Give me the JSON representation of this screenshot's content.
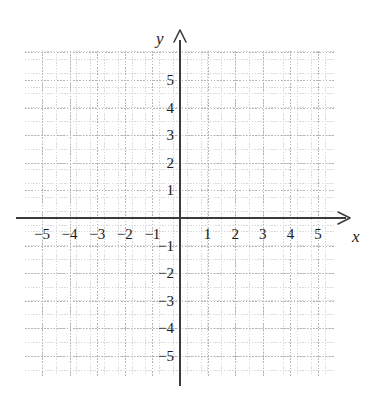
{
  "figure": {
    "kind": "cartesian-coordinate-grid",
    "top_remnant_text": "· · ·",
    "background_color": "#ffffff",
    "axis_color": "#3b3b3b",
    "major_grid_color": "#b5b5b5",
    "minor_grid_color": "#d8d8d8",
    "label_color": "#1a1a1a"
  },
  "axes": {
    "x": {
      "name": "x",
      "arrow": "arrow-right",
      "tick_labels": [
        "−5",
        "−4",
        "−3",
        "−2",
        "−1",
        "1",
        "2",
        "3",
        "4",
        "5"
      ],
      "tick_values": [
        -5,
        -4,
        -3,
        -2,
        -1,
        1,
        2,
        3,
        4,
        5
      ],
      "range": [
        -5.6,
        5.6
      ]
    },
    "y": {
      "name": "y",
      "arrow": "arrow-up",
      "tick_labels": [
        "5",
        "4",
        "3",
        "2",
        "1",
        "−1",
        "−2",
        "−3",
        "−4",
        "−5"
      ],
      "tick_values": [
        5,
        4,
        3,
        2,
        1,
        -1,
        -2,
        -3,
        -4,
        -5
      ],
      "range": [
        -5.8,
        6.0
      ]
    }
  },
  "chart_data": {
    "type": "scatter",
    "title": "",
    "subtitle": "",
    "xlabel": "x",
    "ylabel": "y",
    "xlim": [
      -5.6,
      5.6
    ],
    "ylim": [
      -5.8,
      6.0
    ],
    "xticks": [
      -5,
      -4,
      -3,
      -2,
      -1,
      1,
      2,
      3,
      4,
      5
    ],
    "yticks": [
      5,
      4,
      3,
      2,
      1,
      -1,
      -2,
      -3,
      -4,
      -5
    ],
    "xticklabels": [
      "−5",
      "−4",
      "−3",
      "−2",
      "−1",
      "1",
      "2",
      "3",
      "4",
      "5"
    ],
    "yticklabels": [
      "5",
      "4",
      "3",
      "2",
      "1",
      "−1",
      "−2",
      "−3",
      "−4",
      "−5"
    ],
    "grid": true,
    "grid_style": "dotted",
    "minor_grid": true,
    "minor_ticks_per_unit": 4,
    "legend": null,
    "series": [],
    "points": [],
    "annotations": []
  },
  "grid_geometry": {
    "unit_px": 27.6,
    "origin_x_px": 180,
    "origin_y_px": 218,
    "plate_left_px": 25,
    "plate_top_px": 51,
    "plate_width_px": 310,
    "plate_height_px": 325
  }
}
